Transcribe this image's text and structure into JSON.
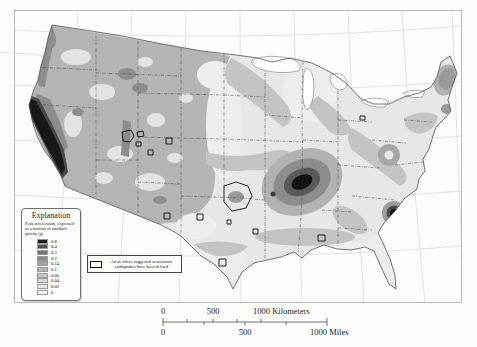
{
  "legend": {
    "title": "Explanation",
    "subtitle": "Peak acceleration, expressed as a fraction of standard gravity (g)",
    "entries": [
      {
        "label": "0.8",
        "color": "#1b1b1b"
      },
      {
        "label": "0.4",
        "color": "#4e4e4c"
      },
      {
        "label": "0.3",
        "color": "#757573"
      },
      {
        "label": "0.2",
        "color": "#8e8e8c"
      },
      {
        "label": "0.14",
        "color": "#a2a2a0"
      },
      {
        "label": "0.1",
        "color": "#b4b4b2"
      },
      {
        "label": "0.06",
        "color": "#c6c6c4"
      },
      {
        "label": "0.04",
        "color": "#d7d7d5"
      },
      {
        "label": "0.02",
        "color": "#e7e7e5"
      },
      {
        "label": "0",
        "color": "#fbfbf9"
      }
    ]
  },
  "note": {
    "text": "Areas where suggested neotectonic earthquakes have been deleted"
  },
  "scalebar": {
    "km_0": "0",
    "km_500": "500",
    "km_1000": "1000 Kilometers",
    "mi_0": "0",
    "mi_500": "500",
    "mi_1000": "1000 Miles"
  },
  "colors": {
    "land_base": "#e7e7e5",
    "hazard_max": "#131313",
    "graticule": "#d6d6d4",
    "frame": "#a8a8a6"
  }
}
